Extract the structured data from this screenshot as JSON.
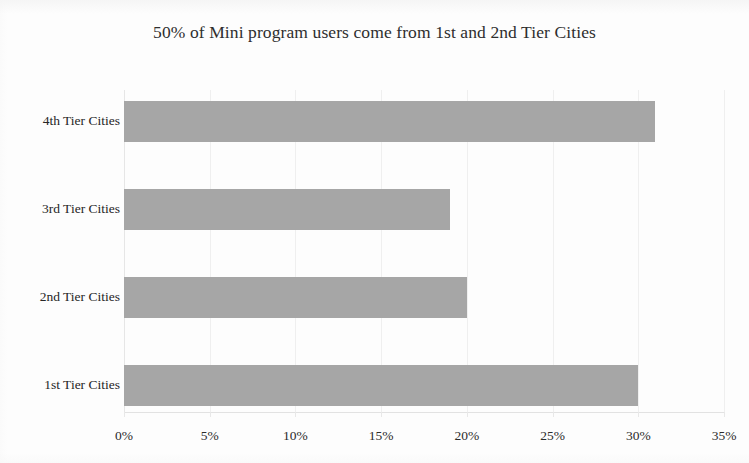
{
  "chart_data": {
    "type": "bar",
    "orientation": "horizontal",
    "title": "50% of Mini program users come from 1st and 2nd Tier Cities",
    "categories": [
      "1st Tier Cities",
      "2nd Tier Cities",
      "3rd Tier Cities",
      "4th Tier Cities"
    ],
    "values": [
      30,
      20,
      19,
      31
    ],
    "value_unit": "%",
    "xlabel": "",
    "ylabel": "",
    "xlim": [
      0,
      35
    ],
    "xticks": [
      0,
      5,
      10,
      15,
      20,
      25,
      30,
      35
    ],
    "xtick_labels": [
      "0%",
      "5%",
      "10%",
      "15%",
      "20%",
      "25%",
      "30%",
      "35%"
    ],
    "grid": true,
    "grid_axis": "x",
    "legend": false,
    "series": [
      {
        "name": "Share of Mini program users",
        "values": [
          30,
          20,
          19,
          31
        ],
        "color": "#a6a6a6"
      }
    ],
    "bar_color": "#a6a6a6",
    "background_color": "#fdfdfd",
    "category_order_top_to_bottom": [
      "4th Tier Cities",
      "3rd Tier Cities",
      "2nd Tier Cities",
      "1st Tier Cities"
    ]
  }
}
